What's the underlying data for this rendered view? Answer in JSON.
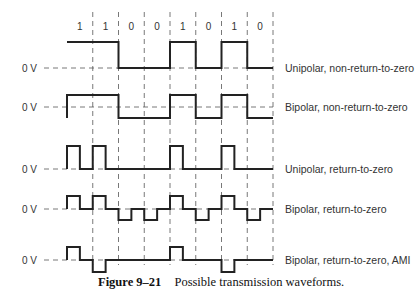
{
  "bits": [
    "1",
    "1",
    "0",
    "0",
    "1",
    "0",
    "1",
    "0"
  ],
  "zero_label": "0 V",
  "rows": [
    {
      "name": "unipolar-nrz",
      "label": "Unipolar, non-return-to-zero",
      "levels": [
        1,
        1,
        0,
        0,
        1,
        0,
        1,
        0
      ],
      "rz": false
    },
    {
      "name": "bipolar-nrz",
      "label": "Bipolar, non-return-to-zero",
      "levels": [
        1,
        1,
        -1,
        -1,
        1,
        -1,
        1,
        -1
      ],
      "rz": false
    },
    {
      "name": "unipolar-rz",
      "label": "Unipolar, return-to-zero",
      "levels": [
        1,
        1,
        0,
        0,
        1,
        0,
        1,
        0
      ],
      "rz": true
    },
    {
      "name": "bipolar-rz",
      "label": "Bipolar, return-to-zero",
      "levels": [
        1,
        1,
        -1,
        -1,
        1,
        -1,
        1,
        -1
      ],
      "rz": true
    },
    {
      "name": "bipolar-rz-ami",
      "label": "Bipolar, return-to-zero, AMI",
      "levels": [
        1,
        -1,
        0,
        0,
        1,
        0,
        -1,
        0
      ],
      "rz": true
    }
  ],
  "caption": {
    "number": "Figure 9–21",
    "text": "Possible transmission waveforms."
  },
  "colors": {
    "trace": "#222222",
    "dashed": "#555555"
  }
}
